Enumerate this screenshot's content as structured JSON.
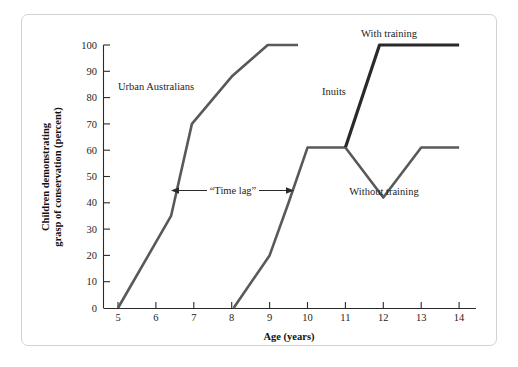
{
  "chart_data": {
    "type": "line",
    "title": "",
    "xlabel": "Age (years)",
    "ylabel": "Children demonstrating grasp of conservation (percent)",
    "ylabel_line1": "Children demonstrating",
    "ylabel_line2": "grasp of conservation (percent)",
    "xlim": [
      4.5,
      14.4
    ],
    "ylim": [
      0,
      100
    ],
    "xticks": [
      5,
      6,
      7,
      8,
      9,
      10,
      11,
      12,
      13,
      14
    ],
    "xtick_labels": [
      "5",
      "6",
      "7",
      "8",
      "9",
      "10",
      "11",
      "12",
      "13",
      "14"
    ],
    "yticks": [
      0,
      10,
      20,
      30,
      40,
      50,
      60,
      70,
      80,
      90,
      100
    ],
    "ytick_labels": [
      "0",
      "10",
      "20",
      "30",
      "40",
      "50",
      "60",
      "70",
      "80",
      "90",
      "100"
    ],
    "grid": false,
    "legend_position": "inline-annotations",
    "series": [
      {
        "name": "Urban Australians",
        "color": "#595959",
        "width": 2.6,
        "label_x": 7.0,
        "label_y": 80,
        "points": [
          {
            "x": 5.0,
            "y": 0
          },
          {
            "x": 6.4,
            "y": 35
          },
          {
            "x": 6.95,
            "y": 70
          },
          {
            "x": 8.0,
            "y": 88
          },
          {
            "x": 8.95,
            "y": 100
          },
          {
            "x": 9.75,
            "y": 100
          }
        ]
      },
      {
        "name": "Inuits",
        "color": "#595959",
        "width": 2.6,
        "label_x": 10.55,
        "label_y": 79,
        "points": [
          {
            "x": 8.05,
            "y": 0
          },
          {
            "x": 9.0,
            "y": 20
          },
          {
            "x": 9.5,
            "y": 40
          },
          {
            "x": 10.0,
            "y": 61
          },
          {
            "x": 11.0,
            "y": 61
          }
        ]
      },
      {
        "name": "With training",
        "color": "#2a2a2a",
        "width": 3.2,
        "label_x": 12.4,
        "label_y": 103,
        "points": [
          {
            "x": 11.0,
            "y": 61
          },
          {
            "x": 11.9,
            "y": 100
          },
          {
            "x": 14.0,
            "y": 100
          }
        ]
      },
      {
        "name": "Without training",
        "color": "#595959",
        "width": 2.6,
        "label_x": 12.65,
        "label_y": 45,
        "points": [
          {
            "x": 11.0,
            "y": 61
          },
          {
            "x": 12.0,
            "y": 42
          },
          {
            "x": 13.0,
            "y": 61
          },
          {
            "x": 14.0,
            "y": 61
          }
        ]
      }
    ],
    "annotations": [
      {
        "name": "time-lag",
        "text": "“Time lag”",
        "x_start": 6.6,
        "x_end": 9.55,
        "y": 47,
        "arrow": "double"
      }
    ]
  }
}
